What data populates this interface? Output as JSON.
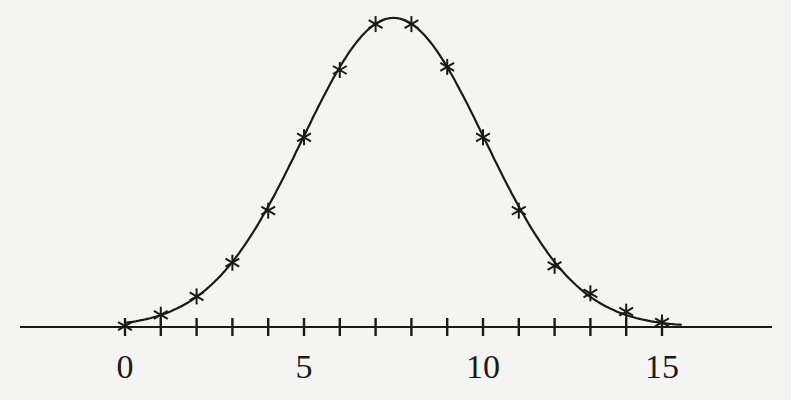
{
  "chart_data": {
    "type": "line",
    "title": "",
    "xlabel": "",
    "ylabel": "",
    "x": [
      0,
      1,
      2,
      3,
      4,
      5,
      6,
      7,
      8,
      9,
      10,
      11,
      12,
      13,
      14,
      15
    ],
    "series": [
      {
        "name": "curve with asterisk markers (relative height)",
        "marker": "asterisk",
        "values": [
          0.003,
          0.04,
          0.1,
          0.21,
          0.38,
          0.62,
          0.84,
          0.99,
          0.99,
          0.85,
          0.62,
          0.38,
          0.2,
          0.11,
          0.05,
          0.015
        ]
      }
    ],
    "xlim": [
      -3,
      18
    ],
    "ylim": [
      0,
      1.02
    ],
    "xticks": [
      0,
      1,
      2,
      3,
      4,
      5,
      6,
      7,
      8,
      9,
      10,
      11,
      12,
      13,
      14,
      15
    ],
    "xtick_labels": [
      {
        "value": 0,
        "label": "0"
      },
      {
        "value": 5,
        "label": "5"
      },
      {
        "value": 10,
        "label": "10"
      },
      {
        "value": 15,
        "label": "15"
      }
    ],
    "grid": false,
    "legend": "none",
    "y_axis_visible": false,
    "line_color": "#1a1a1a",
    "background_color": "#f4f4f2"
  }
}
